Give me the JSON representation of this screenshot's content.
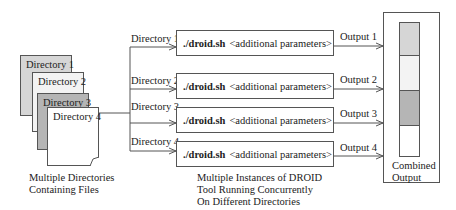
{
  "colors": {
    "dir1": "#d6d6d6",
    "dir2": "#f3f3f3",
    "dir3": "#b5b5b5",
    "dir4": "#ffffff",
    "line": "#555555"
  },
  "directories": {
    "label": "Multiple Directories",
    "label2": "Containing Files",
    "pages": [
      {
        "name": "Directory 1"
      },
      {
        "name": "Directory 2"
      },
      {
        "name": "Directory 3"
      },
      {
        "name": "Directory 4"
      }
    ]
  },
  "instances": {
    "rows": [
      {
        "input": "Directory 1",
        "command": "./droid.sh",
        "params": "<additional parameters>",
        "output": "Output 1"
      },
      {
        "input": "Directory 2",
        "command": "./droid.sh",
        "params": "<additional parameters>",
        "output": "Output 2"
      },
      {
        "input": "Directory 3",
        "command": "./droid.sh",
        "params": "<additional parameters>",
        "output": "Output 3"
      },
      {
        "input": "Directory 4",
        "command": "./droid.sh",
        "params": "<additional parameters>",
        "output": "Output 4"
      }
    ],
    "caption": [
      "Multiple Instances of DROID",
      "Tool Running Concurrently",
      "On Different Directories"
    ]
  },
  "combined": {
    "caption": [
      "Combined",
      "Output"
    ]
  }
}
